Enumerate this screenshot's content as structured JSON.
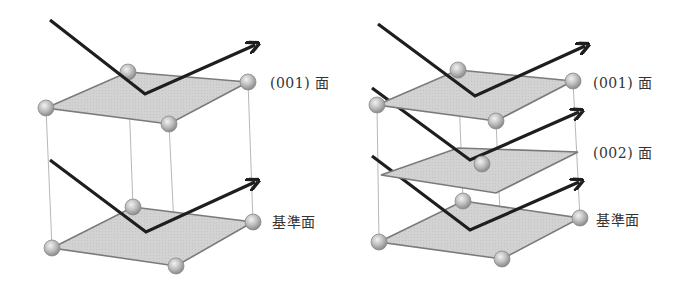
{
  "figures": [
    {
      "id": "single-layer",
      "labels": [
        {
          "text": "(001) 面",
          "x": 272,
          "y": 72
        },
        {
          "text": "基準面",
          "x": 272,
          "y": 212
        }
      ]
    },
    {
      "id": "double-layer",
      "labels": [
        {
          "text": "(001) 面",
          "x": 595,
          "y": 72
        },
        {
          "text": "(002) 面",
          "x": 595,
          "y": 142
        },
        {
          "text": "基準面",
          "x": 597,
          "y": 210
        }
      ]
    }
  ],
  "colors": {
    "plane_fill": "#cfcfcf",
    "plane_edge": "#7a7a7a",
    "atom": "#bdbdbd",
    "arrow": "#1e1e1e",
    "guide": "#b8b8b8"
  }
}
